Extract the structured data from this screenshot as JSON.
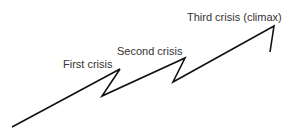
{
  "diagram": {
    "type": "plot-tension-line",
    "line_color": "#111111",
    "labels": {
      "first": "First crisis",
      "second": "Second crisis",
      "third": "Third crisis (climax)"
    },
    "points": [
      [
        12,
        127
      ],
      [
        120,
        69
      ],
      [
        102,
        96
      ],
      [
        185,
        58
      ],
      [
        173,
        82
      ],
      [
        274,
        26
      ],
      [
        270,
        52
      ]
    ]
  }
}
